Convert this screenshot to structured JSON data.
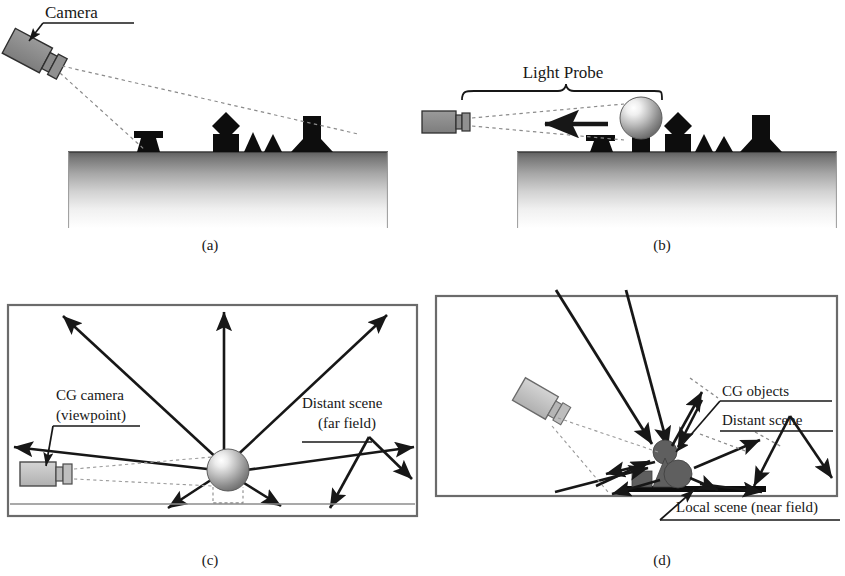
{
  "figure": {
    "panels": [
      {
        "id": "a",
        "caption": "(a)",
        "labels": [
          "Camera"
        ],
        "description": "Real camera photographing a scene of dark objects on a gradient ground plane"
      },
      {
        "id": "b",
        "caption": "(b)",
        "labels": [
          "Light Probe"
        ],
        "description": "Camera photographing a mirrored sphere light probe placed in the scene"
      },
      {
        "id": "c",
        "caption": "(c)",
        "labels": [
          "CG camera",
          "(viewpoint)",
          "Distant scene",
          "(far field)"
        ],
        "description": "Light probe sphere radiating illumination outward to the distant environment"
      },
      {
        "id": "d",
        "caption": "(d)",
        "labels": [
          "CG objects",
          "Distant scene",
          "Local scene (near field)"
        ],
        "description": "CG objects lit by distant scene and local scene near field geometry"
      }
    ]
  },
  "panel_a": {
    "caption": "(a)",
    "camera_label": "Camera"
  },
  "panel_b": {
    "caption": "(b)",
    "probe_label": "Light Probe"
  },
  "panel_c": {
    "caption": "(c)",
    "camera_label_line1": "CG camera",
    "camera_label_line2": "(viewpoint)",
    "distant_label_line1": "Distant scene",
    "distant_label_line2": "(far field)"
  },
  "panel_d": {
    "caption": "(d)",
    "cg_objects_label": "CG objects",
    "distant_scene_label": "Distant scene",
    "local_scene_label": "Local scene (near field)"
  },
  "colors": {
    "ink": "#171717",
    "camera_body": "#8a8a8a",
    "camera_body_light": "#c9c9c9",
    "ground_top": "#6e6e6e",
    "ground_bottom": "#ffffff",
    "panel_border": "#6b6b6b",
    "cg_object": "#6d6d6d",
    "dashed_ray": "#8c8c8c",
    "background": "#ffffff"
  }
}
